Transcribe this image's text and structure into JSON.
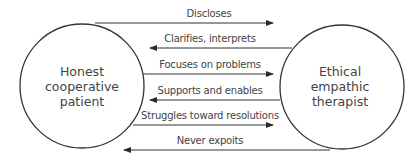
{
  "diagram": {
    "left_node": {
      "lines": [
        "Honest",
        "cooperative",
        "patient"
      ]
    },
    "right_node": {
      "lines": [
        "Ethical",
        "empathic",
        "therapist"
      ]
    },
    "arrows": [
      {
        "label": "Discloses",
        "direction": "right"
      },
      {
        "label": "Clarifies, interprets",
        "direction": "left"
      },
      {
        "label": "Focuses on problems",
        "direction": "right"
      },
      {
        "label": "Supports and enables",
        "direction": "left"
      },
      {
        "label": "Struggles toward resolutions",
        "direction": "right"
      },
      {
        "label": "Never expoits",
        "direction": "left"
      }
    ]
  }
}
